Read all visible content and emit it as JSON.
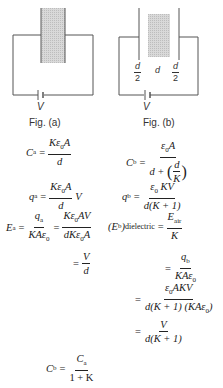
{
  "figures": {
    "a": {
      "caption": "Fig. (a)",
      "battery_label": "V",
      "description": "Parallel plate capacitor fully filled with dielectric slab, connected to battery V"
    },
    "b": {
      "caption": "Fig. (b)",
      "battery_label": "V",
      "gap_labels": [
        "d/2",
        "d",
        "d/2"
      ],
      "gap_left_num": "d",
      "gap_left_den": "2",
      "gap_mid": "d",
      "gap_right_num": "d",
      "gap_right_den": "2",
      "description": "Parallel plate capacitor with dielectric slab of thickness d and air gaps d/2 on each side"
    }
  },
  "equations": {
    "left": {
      "Ca": {
        "lhs": "C",
        "lhs_sub": "a",
        "op": "=",
        "num": "Kε",
        "num_sub": "0",
        "num_tail": "A",
        "den": "d"
      },
      "qa": {
        "lhs": "q",
        "lhs_sub": "a",
        "op": "=",
        "num": "Kε",
        "num_sub": "0",
        "num_tail": "A",
        "den": "d",
        "tail": "V"
      },
      "Ea": {
        "lhs": "E",
        "lhs_sub": "a",
        "op": "=",
        "num1": "q",
        "num1_sub": "a",
        "den1": "KAε",
        "den1_sub": "0",
        "op2": "=",
        "num2": "Kε",
        "num2_sub": "0",
        "num2_tail": "AV",
        "den2": "dKε",
        "den2_sub": "0",
        "den2_tail": "A"
      },
      "Ea2": {
        "op": "=",
        "num": "V",
        "den": "d"
      },
      "Cb_ratio": {
        "lhs": "C",
        "lhs_sub": "b",
        "op": "=",
        "num": "C",
        "num_sub": "a",
        "den": "1 + K"
      }
    },
    "right": {
      "Cb": {
        "lhs": "C",
        "lhs_sub": "b",
        "op": "=",
        "num": "ε",
        "num_sub": "0",
        "num_tail": "A",
        "den_pre": "d + ",
        "den_inner_num": "d",
        "den_inner_den": "K"
      },
      "qb": {
        "lhs": "q",
        "lhs_sub": "b",
        "op": "=",
        "num": "ε",
        "num_sub": "0",
        "num_tail": " KV",
        "den": "d(K + 1)"
      },
      "Eb": {
        "lhs": "(E",
        "lhs_sub": "b",
        "lhs_close": ")",
        "lhs_sub2": "dielectric",
        "op": "=",
        "num": "E",
        "num_sub": "air",
        "den": "K"
      },
      "Eb2": {
        "op": "=",
        "num": "q",
        "num_sub": "b",
        "den": "KAε",
        "den_sub": "0"
      },
      "Eb3": {
        "op": "=",
        "num": "ε",
        "num_sub": "0",
        "num_tail": "AKV",
        "den": "d(K + 1) (KAε",
        "den_sub": "0",
        "den_tail": ")"
      },
      "Eb4": {
        "op": "=",
        "num": "V",
        "den": "d(K + 1)"
      }
    }
  }
}
